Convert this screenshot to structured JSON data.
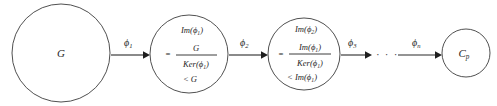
{
  "diagram": {
    "type": "group-homomorphism-chain",
    "background_color": "#ffffff",
    "stroke_color": "#3c3c3c",
    "text_color": "#262626",
    "nodes": [
      {
        "id": "node-g",
        "label": "G",
        "kind": "single-line",
        "cx": 61,
        "cy": 53,
        "r": 49
      },
      {
        "id": "node-im-phi1",
        "kind": "quotient",
        "cx": 189,
        "cy": 54,
        "r": 39,
        "line1": "Im(ϕ",
        "line1_sub": "1",
        "line1_tail": ")",
        "equals": "=",
        "numerator": "G",
        "denominator": "Ker(ϕ",
        "denominator_sub": "1",
        "denominator_tail": ")",
        "line4": "< G"
      },
      {
        "id": "node-im-phi2",
        "kind": "quotient",
        "cx": 304,
        "cy": 54,
        "r": 36,
        "line1": "Im(ϕ",
        "line1_sub": "2",
        "line1_tail": ")",
        "equals": "=",
        "numerator": "Im(ϕ",
        "numerator_sub": "1",
        "numerator_tail": ")",
        "denominator": "Ker(ϕ",
        "denominator_sub": "1",
        "denominator_tail": ")",
        "line4": "< Im(ϕ",
        "line4_sub": "1",
        "line4_tail": ")"
      },
      {
        "id": "node-cp",
        "kind": "single-line",
        "label": "C",
        "label_sub": "p",
        "cx": 466,
        "cy": 53,
        "r": 24
      }
    ],
    "edges": [
      {
        "id": "edge-phi1",
        "label": "ϕ",
        "label_sub": "1",
        "x1": 111,
        "x2": 149,
        "y": 55,
        "label_x": 124,
        "label_y": 44
      },
      {
        "id": "edge-phi2",
        "label": "ϕ",
        "label_sub": "2",
        "x1": 229,
        "x2": 267,
        "y": 55,
        "label_x": 240,
        "label_y": 44
      },
      {
        "id": "edge-phi3",
        "label": "ϕ",
        "label_sub": "3",
        "x1": 341,
        "x2": 371,
        "y": 55,
        "label_x": 348,
        "label_y": 44
      },
      {
        "id": "edge-phin",
        "label": "ϕ",
        "label_sub": "n",
        "x1": 398,
        "x2": 441,
        "y": 55,
        "label_x": 414,
        "label_y": 44
      }
    ],
    "ellipsis": {
      "id": "chain-ellipsis",
      "text": "· · ·",
      "x": 376,
      "y": 58
    }
  }
}
